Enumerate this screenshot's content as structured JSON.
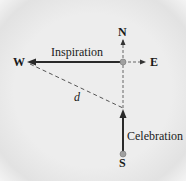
{
  "diagram": {
    "compass": {
      "north": "N",
      "south": "S",
      "east": "E",
      "west": "W"
    },
    "vectors": [
      {
        "label": "Inspiration",
        "direction": "west",
        "style": "solid"
      },
      {
        "label": "Celebration",
        "direction": "north",
        "style": "solid"
      }
    ],
    "resultant": {
      "label": "d",
      "style": "dashed"
    },
    "colors": {
      "line": "#2a2a2a",
      "dashed": "#555555",
      "point": "#9a9a9a",
      "background": "#ececec"
    }
  }
}
